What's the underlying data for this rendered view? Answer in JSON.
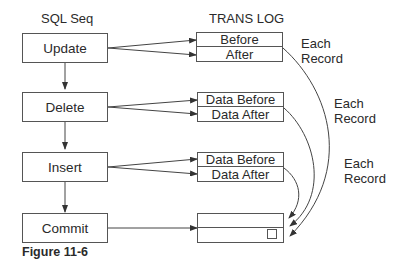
{
  "headers": {
    "sql_seq": "SQL Seq",
    "trans_log": "TRANS LOG"
  },
  "sql_steps": [
    {
      "label": "Update"
    },
    {
      "label": "Delete"
    },
    {
      "label": "Insert"
    },
    {
      "label": "Commit"
    }
  ],
  "log_entries": [
    {
      "top": "Before",
      "bottom": "After"
    },
    {
      "top": "Data Before",
      "bottom": "Data After"
    },
    {
      "top": "Data Before",
      "bottom": "Data After"
    },
    {
      "top": "",
      "bottom": ""
    }
  ],
  "annotations": [
    {
      "line1": "Each",
      "line2": "Record"
    },
    {
      "line1": "Each",
      "line2": "Record"
    },
    {
      "line1": "Each",
      "line2": "Record"
    }
  ],
  "caption": "Figure 11-6"
}
